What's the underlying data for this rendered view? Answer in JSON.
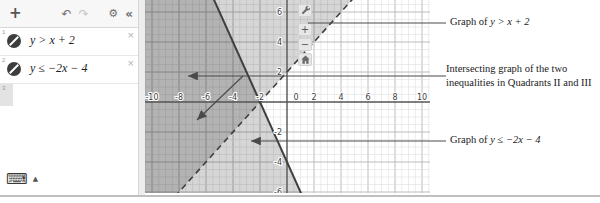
{
  "panel": {
    "toolbar": {
      "add": "+",
      "undo": "↶",
      "redo": "↷",
      "settings": "⚙",
      "collapse": "«"
    },
    "expressions": [
      {
        "index": "1",
        "latex": "y > x + 2"
      },
      {
        "index": "2",
        "latex": "y ≤ −2x − 4"
      },
      {
        "index": "3",
        "latex": ""
      }
    ],
    "keyboard": {
      "icon": "⌨",
      "arrow": "▲"
    }
  },
  "graph_controls": {
    "zoom_in": "+",
    "zoom_out": "−"
  },
  "annotations": [
    {
      "prefix": "Graph of ",
      "math": "y > x + 2"
    },
    {
      "line1": "Intersecting graph of the two",
      "line2": "inequalities in Quadrants II and III"
    },
    {
      "prefix": "Graph of ",
      "math": "y ≤ −2x − 4"
    }
  ],
  "chart_data": {
    "type": "line",
    "subtype": "linear-inequality-system",
    "series": [
      {
        "name": "y > x + 2",
        "slope": 1,
        "y_intercept": 2,
        "line_style": "dashed",
        "shade": "above",
        "strict": true
      },
      {
        "name": "y ≤ −2x − 4",
        "slope": -2,
        "y_intercept": -4,
        "line_style": "solid",
        "shade": "below",
        "strict": false
      }
    ],
    "intersection_point": [
      -2,
      0
    ],
    "x_tick_labels": [
      -10,
      -8,
      -6,
      -4,
      -2,
      0,
      2,
      4,
      6,
      8,
      10
    ],
    "y_tick_labels": [
      6,
      4,
      2,
      -2,
      -4,
      -6
    ],
    "xlim": [
      -10.55,
      10.65
    ],
    "ylim": [
      -6.1,
      6.8
    ],
    "grid": true,
    "minor_step": 0.5,
    "major_step": 2,
    "line_color": "#3f3f3f",
    "shade_color": "rgba(0,0,0,0.16)",
    "axis_color": "#555555"
  }
}
